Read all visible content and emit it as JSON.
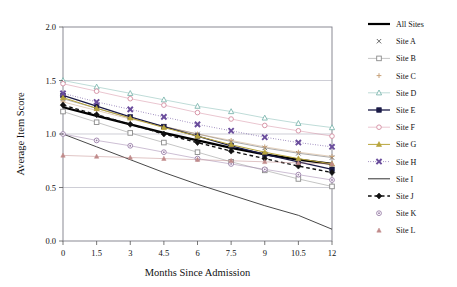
{
  "chart_data": {
    "type": "line",
    "title": "",
    "xlabel": "Months Since Admission",
    "ylabel": "Average Item Score",
    "xlim": [
      0,
      12
    ],
    "ylim": [
      0.0,
      2.0
    ],
    "x": [
      0,
      1.5,
      3,
      4.5,
      6,
      7.5,
      9,
      10.5,
      12
    ],
    "xticks": [
      "0",
      "1.5",
      "3",
      "4.5",
      "6",
      "7.5",
      "9",
      "10.5",
      "12"
    ],
    "yticks": [
      "0.0",
      "0.5",
      "1.0",
      "1.5",
      "2.0"
    ],
    "grid": "horizontal",
    "legend_position": "right",
    "series": [
      {
        "name": "All Sites",
        "marker": "none",
        "line": "solid",
        "width": 2.2,
        "color": "#000000",
        "values": [
          1.25,
          1.17,
          1.09,
          1.01,
          0.94,
          0.87,
          0.81,
          0.76,
          0.72
        ]
      },
      {
        "name": "Site A",
        "marker": "x",
        "line": "solid",
        "width": 0.5,
        "color": "#555555",
        "values": [
          1.33,
          1.24,
          1.15,
          1.07,
          1.0,
          0.93,
          0.87,
          0.82,
          0.78
        ]
      },
      {
        "name": "Site B",
        "marker": "square-open",
        "line": "solid",
        "width": 0.5,
        "color": "#8a8a8a",
        "values": [
          1.21,
          1.11,
          1.01,
          0.92,
          0.83,
          0.74,
          0.66,
          0.58,
          0.51
        ]
      },
      {
        "name": "Site C",
        "marker": "plus",
        "line": "solid",
        "width": 0.5,
        "color": "#c8a27a",
        "values": [
          1.3,
          1.22,
          1.14,
          1.07,
          1.0,
          0.94,
          0.88,
          0.83,
          0.79
        ]
      },
      {
        "name": "Site D",
        "marker": "triangle-open",
        "line": "solid",
        "width": 0.5,
        "color": "#7fb8b0",
        "values": [
          1.5,
          1.44,
          1.38,
          1.32,
          1.26,
          1.21,
          1.15,
          1.1,
          1.06
        ]
      },
      {
        "name": "Site E",
        "marker": "square-filled",
        "line": "solid",
        "width": 1.3,
        "color": "#1a1a46",
        "values": [
          1.36,
          1.26,
          1.16,
          1.07,
          0.98,
          0.89,
          0.81,
          0.74,
          0.67
        ]
      },
      {
        "name": "Site F",
        "marker": "circle-open",
        "line": "solid",
        "width": 0.5,
        "color": "#d48ca0",
        "values": [
          1.47,
          1.4,
          1.33,
          1.27,
          1.2,
          1.14,
          1.08,
          1.03,
          0.98
        ]
      },
      {
        "name": "Site G",
        "marker": "triangle-filled",
        "line": "solid",
        "width": 1.0,
        "color": "#b8a53c",
        "values": [
          1.34,
          1.24,
          1.15,
          1.06,
          0.98,
          0.9,
          0.83,
          0.77,
          0.72
        ]
      },
      {
        "name": "Site H",
        "marker": "x-bold",
        "line": "dotted",
        "width": 1.0,
        "color": "#6a4d9c",
        "values": [
          1.38,
          1.3,
          1.23,
          1.16,
          1.09,
          1.03,
          0.97,
          0.92,
          0.88
        ]
      },
      {
        "name": "Site I",
        "marker": "none",
        "line": "solid",
        "width": 0.9,
        "color": "#333333",
        "values": [
          1.0,
          0.88,
          0.76,
          0.64,
          0.53,
          0.43,
          0.33,
          0.24,
          0.11
        ]
      },
      {
        "name": "Site J",
        "marker": "diamond-filled",
        "line": "dashed",
        "width": 1.4,
        "color": "#111111",
        "values": [
          1.27,
          1.18,
          1.09,
          1.0,
          0.92,
          0.84,
          0.77,
          0.7,
          0.64
        ]
      },
      {
        "name": "Site K",
        "marker": "circle-dot",
        "line": "solid",
        "width": 0.5,
        "color": "#9a7fa8",
        "values": [
          1.0,
          0.94,
          0.89,
          0.83,
          0.77,
          0.72,
          0.67,
          0.62,
          0.57
        ]
      },
      {
        "name": "Site L",
        "marker": "triangle-small",
        "line": "solid",
        "width": 0.5,
        "color": "#c08a8a",
        "values": [
          0.8,
          0.79,
          0.78,
          0.77,
          0.76,
          0.75,
          0.74,
          0.73,
          0.72
        ]
      }
    ]
  },
  "legend": {
    "items": [
      {
        "label": "All Sites"
      },
      {
        "label": "Site A"
      },
      {
        "label": "Site B"
      },
      {
        "label": "Site C"
      },
      {
        "label": "Site D"
      },
      {
        "label": "Site E"
      },
      {
        "label": "Site F"
      },
      {
        "label": "Site G"
      },
      {
        "label": "Site H"
      },
      {
        "label": "Site I"
      },
      {
        "label": "Site J"
      },
      {
        "label": "Site K"
      },
      {
        "label": "Site L"
      }
    ]
  }
}
